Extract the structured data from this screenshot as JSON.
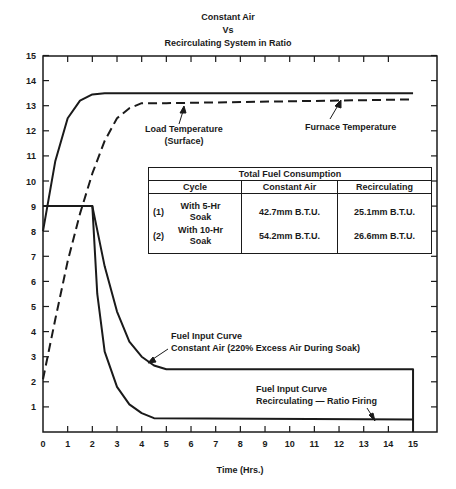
{
  "title": {
    "line1": "Constant Air",
    "line2": "Vs",
    "line3": "Recirculating System in Ratio"
  },
  "axes": {
    "xlabel": "Time (Hrs.)",
    "x_ticks": [
      "0",
      "1",
      "2",
      "3",
      "4",
      "5",
      "6",
      "7",
      "8",
      "9",
      "10",
      "11",
      "12",
      "13",
      "14",
      "15"
    ],
    "y_ticks": [
      "1",
      "2",
      "3",
      "4",
      "5",
      "6",
      "7",
      "8",
      "9",
      "10",
      "11",
      "12",
      "13",
      "14",
      "15"
    ]
  },
  "annotations": {
    "load_temp_1": "Load Temperature",
    "load_temp_2": "(Surface)",
    "furnace_temp": "Furnace Temperature",
    "fuel_const_1": "Fuel Input Curve",
    "fuel_const_2": "Constant Air (220% Excess Air During Soak)",
    "fuel_recirc_1": "Fuel Input Curve",
    "fuel_recirc_2": "Recirculating — Ratio Firing"
  },
  "table": {
    "title": "Total Fuel Consumption",
    "headers": [
      "Cycle",
      "Constant Air",
      "Recirculating"
    ],
    "rows": [
      {
        "num": "(1)",
        "cycle_1": "With 5-Hr",
        "cycle_2": "Soak",
        "constant_air": "42.7mm B.T.U.",
        "recirculating": "25.1mm B.T.U."
      },
      {
        "num": "(2)",
        "cycle_1": "With 10-Hr",
        "cycle_2": "Soak",
        "constant_air": "54.2mm B.T.U.",
        "recirculating": "26.6mm B.T.U."
      }
    ]
  },
  "chart_data": {
    "type": "line",
    "xlabel": "Time (Hrs.)",
    "ylabel": "",
    "xlim": [
      0,
      15
    ],
    "ylim": [
      0,
      15
    ],
    "grid": false,
    "series": [
      {
        "name": "Furnace Temperature",
        "style": "solid",
        "x": [
          0,
          0.5,
          1,
          1.5,
          2,
          2.5,
          3,
          15
        ],
        "y": [
          8.0,
          10.8,
          12.5,
          13.2,
          13.45,
          13.5,
          13.5,
          13.5
        ]
      },
      {
        "name": "Load Temperature (Surface)",
        "style": "dashed",
        "x": [
          0,
          0.5,
          1,
          1.5,
          2,
          2.5,
          3,
          3.5,
          4,
          5,
          15
        ],
        "y": [
          2.1,
          4.5,
          6.8,
          8.7,
          10.3,
          11.6,
          12.5,
          12.9,
          13.1,
          13.1,
          13.25
        ]
      },
      {
        "name": "Fuel Input Curve Constant Air (220% Excess Air During Soak)",
        "style": "solid",
        "x": [
          0,
          2,
          2.5,
          3,
          3.5,
          4,
          4.5,
          5,
          15,
          15
        ],
        "y": [
          9,
          9,
          6.6,
          4.8,
          3.6,
          3.0,
          2.65,
          2.5,
          2.5,
          0
        ]
      },
      {
        "name": "Fuel Input Curve Recirculating — Ratio Firing",
        "style": "solid",
        "x": [
          0,
          2,
          2.2,
          2.5,
          3,
          3.5,
          4,
          4.5,
          15
        ],
        "y": [
          9,
          9,
          5.5,
          3.2,
          1.8,
          1.1,
          0.75,
          0.55,
          0.5
        ]
      }
    ],
    "table": {
      "title": "Total Fuel Consumption",
      "columns": [
        "Cycle",
        "Constant Air",
        "Recirculating"
      ],
      "rows": [
        [
          "(1) With 5-Hr Soak",
          "42.7mm B.T.U.",
          "25.1mm B.T.U."
        ],
        [
          "(2) With 10-Hr Soak",
          "54.2mm B.T.U.",
          "26.6mm B.T.U."
        ]
      ]
    }
  }
}
